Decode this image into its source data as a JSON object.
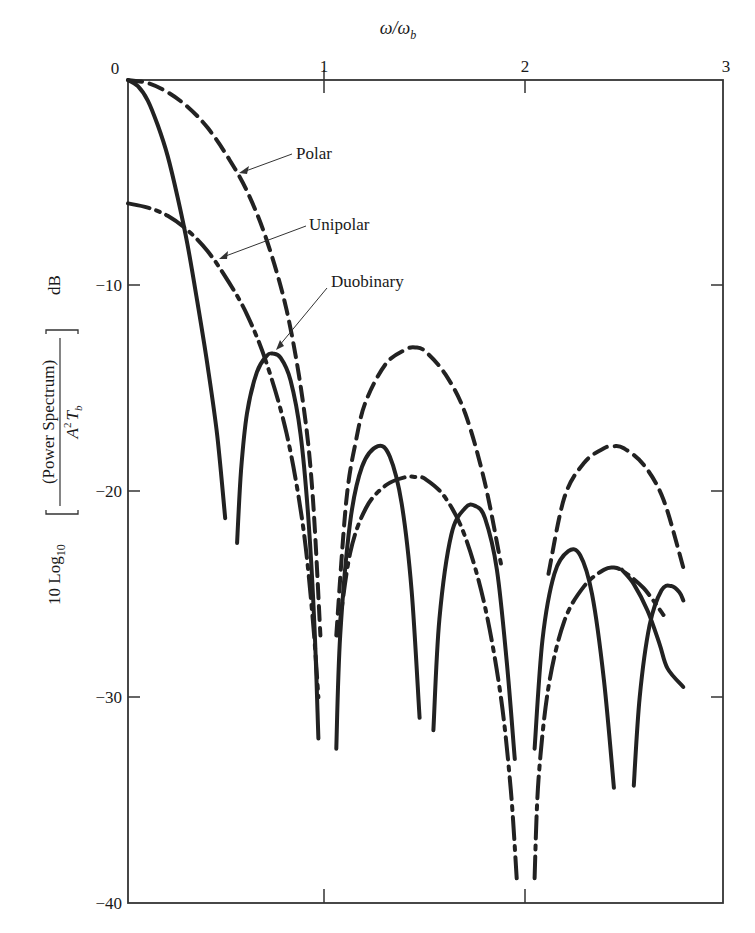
{
  "chart_data": {
    "type": "line",
    "title": "",
    "xlabel": "ω/ω_b",
    "xlabel_position": "top",
    "ylabel": "10 Log10 [ (Power Spectrum) / (A² T_b) ] dB",
    "ylabel_parts": {
      "prefix": "10 Log",
      "subscript": "10",
      "numerator": "(Power Spectrum)",
      "denominator_A": "A",
      "denominator_sup": "2",
      "denominator_T": "T",
      "denominator_sub": "b",
      "unit": "dB"
    },
    "xlim": [
      0,
      3
    ],
    "ylim": [
      -40,
      0
    ],
    "x_ticks": [
      "0",
      "1",
      "2",
      "3"
    ],
    "y_ticks": [
      "−10",
      "−20",
      "−30",
      "−40"
    ],
    "grid": false,
    "legend": "annotations with arrows",
    "series": [
      {
        "name": "Polar",
        "style": "dashed",
        "segments": [
          [
            [
              0.0,
              0.0
            ],
            [
              0.1,
              -0.15
            ],
            [
              0.2,
              -0.6
            ],
            [
              0.3,
              -1.3
            ],
            [
              0.4,
              -2.3
            ],
            [
              0.5,
              -3.7
            ],
            [
              0.6,
              -5.4
            ],
            [
              0.7,
              -7.8
            ],
            [
              0.8,
              -11.2
            ],
            [
              0.88,
              -15.5
            ],
            [
              0.93,
              -20
            ],
            [
              0.97,
              -27
            ]
          ],
          [
            [
              1.05,
              -27
            ],
            [
              1.1,
              -20.5
            ],
            [
              1.15,
              -17.5
            ],
            [
              1.2,
              -15.6
            ],
            [
              1.3,
              -13.8
            ],
            [
              1.4,
              -13.1
            ],
            [
              1.45,
              -13.0
            ],
            [
              1.5,
              -13.2
            ],
            [
              1.6,
              -14.3
            ],
            [
              1.7,
              -16.2
            ],
            [
              1.8,
              -19.6
            ],
            [
              1.88,
              -23.5
            ]
          ],
          [
            [
              2.12,
              -24
            ],
            [
              2.2,
              -20.3
            ],
            [
              2.3,
              -18.6
            ],
            [
              2.4,
              -17.9
            ],
            [
              2.45,
              -17.8
            ],
            [
              2.5,
              -17.9
            ],
            [
              2.6,
              -18.7
            ],
            [
              2.7,
              -20.4
            ],
            [
              2.8,
              -23.7
            ]
          ]
        ]
      },
      {
        "name": "Unipolar",
        "style": "dash-dot",
        "segments": [
          [
            [
              0.0,
              -6.0
            ],
            [
              0.1,
              -6.2
            ],
            [
              0.2,
              -6.6
            ],
            [
              0.3,
              -7.3
            ],
            [
              0.4,
              -8.3
            ],
            [
              0.5,
              -9.7
            ],
            [
              0.6,
              -11.4
            ],
            [
              0.7,
              -13.8
            ],
            [
              0.8,
              -17.2
            ],
            [
              0.88,
              -21.5
            ],
            [
              0.93,
              -26
            ],
            [
              0.96,
              -30
            ]
          ],
          [
            [
              1.06,
              -27
            ],
            [
              1.12,
              -23
            ],
            [
              1.2,
              -20.8
            ],
            [
              1.3,
              -19.7
            ],
            [
              1.4,
              -19.3
            ],
            [
              1.45,
              -19.3
            ],
            [
              1.5,
              -19.4
            ],
            [
              1.6,
              -20.3
            ],
            [
              1.7,
              -22.2
            ],
            [
              1.8,
              -25.6
            ],
            [
              1.88,
              -30
            ],
            [
              1.93,
              -34.5
            ],
            [
              1.96,
              -38.8
            ]
          ],
          [
            [
              2.05,
              -38.8
            ],
            [
              2.07,
              -34
            ],
            [
              2.12,
              -29.5
            ],
            [
              2.2,
              -26.3
            ],
            [
              2.3,
              -24.6
            ],
            [
              2.4,
              -23.8
            ],
            [
              2.45,
              -23.7
            ],
            [
              2.5,
              -23.9
            ],
            [
              2.6,
              -24.7
            ],
            [
              2.7,
              -26.0
            ]
          ]
        ]
      },
      {
        "name": "Duobinary",
        "style": "solid",
        "segments": [
          [
            [
              0.0,
              0.0
            ],
            [
              0.05,
              -0.3
            ],
            [
              0.1,
              -1.0
            ],
            [
              0.15,
              -2.2
            ],
            [
              0.2,
              -3.7
            ],
            [
              0.25,
              -5.7
            ],
            [
              0.3,
              -8.0
            ],
            [
              0.35,
              -10.8
            ],
            [
              0.4,
              -13.8
            ],
            [
              0.45,
              -17.3
            ],
            [
              0.49,
              -21.3
            ]
          ],
          [
            [
              0.55,
              -22.5
            ],
            [
              0.57,
              -19
            ],
            [
              0.6,
              -16.2
            ],
            [
              0.65,
              -14.2
            ],
            [
              0.7,
              -13.4
            ],
            [
              0.73,
              -13.3
            ],
            [
              0.77,
              -13.5
            ],
            [
              0.82,
              -14.6
            ],
            [
              0.87,
              -17.2
            ],
            [
              0.91,
              -21.4
            ],
            [
              0.94,
              -26.5
            ],
            [
              0.96,
              -32
            ]
          ],
          [
            [
              1.05,
              -32.5
            ],
            [
              1.07,
              -27
            ],
            [
              1.12,
              -21.5
            ],
            [
              1.18,
              -18.8
            ],
            [
              1.26,
              -17.8
            ],
            [
              1.32,
              -18.3
            ],
            [
              1.38,
              -20.6
            ],
            [
              1.43,
              -24.8
            ],
            [
              1.47,
              -31
            ]
          ],
          [
            [
              1.54,
              -31.6
            ],
            [
              1.57,
              -26.2
            ],
            [
              1.63,
              -22.1
            ],
            [
              1.7,
              -20.8
            ],
            [
              1.75,
              -20.7
            ],
            [
              1.8,
              -21.3
            ],
            [
              1.86,
              -23.8
            ],
            [
              1.91,
              -28.3
            ],
            [
              1.95,
              -33
            ]
          ],
          [
            [
              2.05,
              -32.5
            ],
            [
              2.09,
              -27.2
            ],
            [
              2.15,
              -24.0
            ],
            [
              2.22,
              -22.9
            ],
            [
              2.28,
              -23.1
            ],
            [
              2.34,
              -25.0
            ],
            [
              2.4,
              -29.2
            ],
            [
              2.45,
              -34.4
            ]
          ],
          [
            [
              2.55,
              -34.3
            ],
            [
              2.58,
              -30
            ],
            [
              2.63,
              -26.5
            ],
            [
              2.69,
              -24.8
            ],
            [
              2.74,
              -24.6
            ],
            [
              2.78,
              -24.9
            ],
            [
              2.8,
              -25.3
            ]
          ],
          [
            [
              2.49,
              -23.8
            ],
            [
              2.55,
              -24.5
            ],
            [
              2.62,
              -25.8
            ],
            [
              2.68,
              -27.4
            ],
            [
              2.72,
              -28.6
            ],
            [
              2.8,
              -29.5
            ]
          ]
        ]
      }
    ],
    "annotations": [
      {
        "text": "Polar",
        "points_to": [
          0.58,
          -5.0
        ]
      },
      {
        "text": "Unipolar",
        "points_to": [
          0.47,
          -9.1
        ]
      },
      {
        "text": "Duobinary",
        "points_to": [
          0.73,
          -13.3
        ]
      }
    ]
  },
  "labels": {
    "xlabel_omega": "ω/ω",
    "xlabel_sub": "b",
    "x0": "0",
    "x1": "1",
    "x2": "2",
    "x3": "3",
    "y10": "−10",
    "y20": "−20",
    "y30": "−30",
    "y40": "−40",
    "polar": "Polar",
    "unipolar": "Unipolar",
    "duobinary": "Duobinary"
  }
}
